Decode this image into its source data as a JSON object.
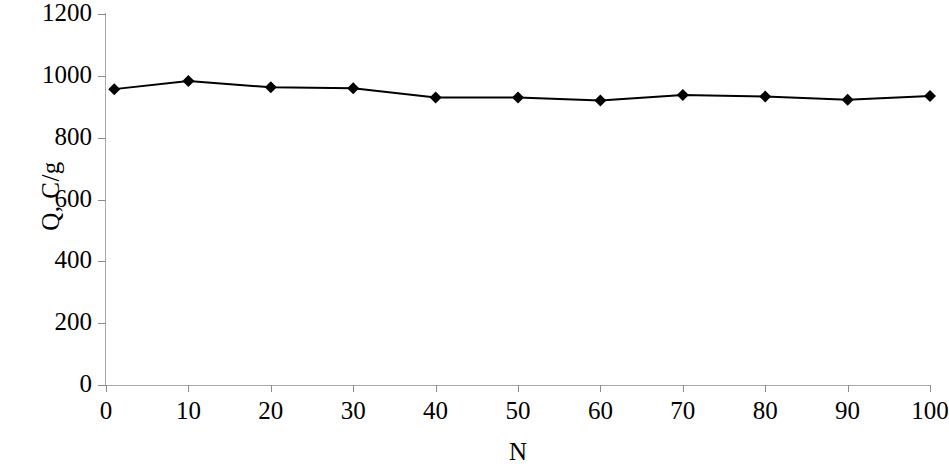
{
  "chart_data": {
    "type": "line",
    "title": "",
    "subtitle": "",
    "xlabel": "N",
    "ylabel": "Q, C/g",
    "xlim": [
      0,
      100
    ],
    "ylim": [
      0,
      1200
    ],
    "xticks": [
      0,
      10,
      20,
      30,
      40,
      50,
      60,
      70,
      80,
      90,
      100
    ],
    "yticks": [
      0,
      200,
      400,
      600,
      800,
      1000,
      1200
    ],
    "xtick_labels": [
      "0",
      "10",
      "20",
      "30",
      "40",
      "50",
      "60",
      "70",
      "80",
      "90",
      "100"
    ],
    "ytick_labels": [
      "0",
      "200",
      "400",
      "600",
      "800",
      "1000",
      "1200"
    ],
    "grid": false,
    "legend": null,
    "legend_position": "none",
    "marker": "diamond",
    "marker_color": "#000000",
    "line_color": "#000000",
    "line_width": 2,
    "background_color": "#ffffff",
    "axis_color": "#a9a9a9",
    "series": [
      {
        "name": "Q",
        "x": [
          1,
          10,
          20,
          30,
          40,
          50,
          60,
          70,
          80,
          90,
          100
        ],
        "values": [
          957,
          983,
          963,
          960,
          930,
          930,
          920,
          938,
          933,
          923,
          935
        ]
      }
    ]
  },
  "figure": {
    "width": 949,
    "height": 470
  }
}
